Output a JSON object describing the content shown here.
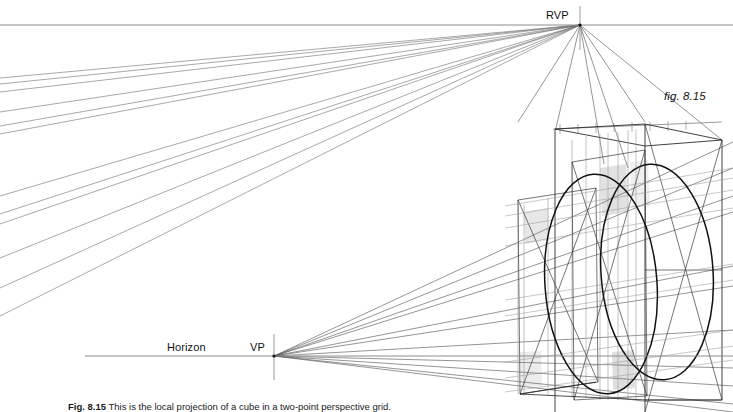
{
  "figure": {
    "number_label": "fig. 8.15",
    "caption_number": "Fig. 8.15",
    "caption_text": "This is the local projection of a cube in a two-point perspective grid."
  },
  "labels": {
    "rvp": "RVP",
    "vp": "VP",
    "horizon": "Horizon"
  },
  "colors": {
    "ink_dark": "#1a1a1a",
    "ink_mid": "#4d4d4d",
    "ink_light": "#8c8c8c",
    "ink_faint": "#b3b3b3",
    "shade_fill": "#c9c9c9",
    "page_background": "#ffffff"
  },
  "geometry": {
    "rvp": {
      "x": 580,
      "y": 25,
      "tick_top": 8,
      "tick_bottom": 48
    },
    "vp": {
      "x": 274,
      "y": 356,
      "tick_top": 334,
      "tick_bottom": 380
    },
    "upper_line": {
      "x1": 0,
      "y1": 25,
      "x2": 733,
      "y2": 25
    },
    "horizon_line": {
      "x1": 85,
      "y1": 356,
      "x2": 733,
      "y2": 356
    },
    "measuring_line": {
      "x1": 555,
      "y1": 128,
      "x2": 722,
      "y2": 122
    },
    "measuring_ticks": [
      560,
      578,
      596,
      614,
      632,
      650,
      668,
      686
    ],
    "box": {
      "front_left_x": 518,
      "front_right_x": 645,
      "back_right_x": 722,
      "top_y": 122,
      "bottom_y": 412
    },
    "rvp_fan_left_edge_y": [
      78,
      84,
      92,
      112,
      126,
      134,
      196,
      214,
      224,
      258,
      288,
      316
    ],
    "vp_fan_right_edge_y": [
      245,
      266,
      288,
      330,
      352,
      370,
      392,
      410
    ],
    "ellipse_major": {
      "cx": 601,
      "cy": 282,
      "rx": 56,
      "ry": 108
    },
    "ellipse_minor": {
      "cx": 655,
      "cy": 270,
      "rx": 56,
      "ry": 106
    }
  }
}
